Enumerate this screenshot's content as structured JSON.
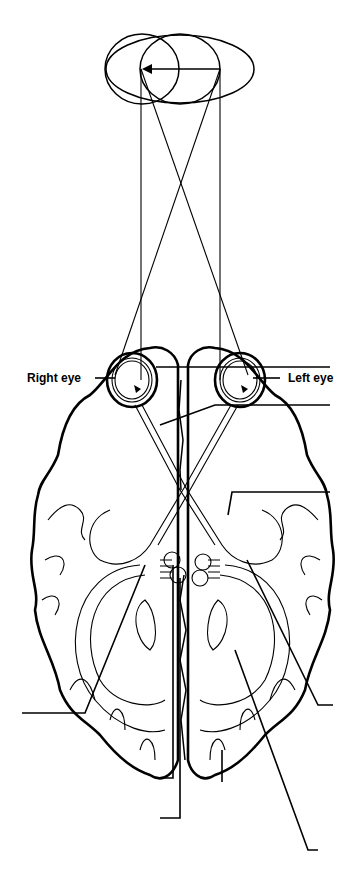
{
  "diagram": {
    "title": "",
    "labels": {
      "right_eye": "Right eye",
      "left_eye": "Left eye"
    },
    "visual_field": {
      "shape": "two overlapping ellipses",
      "arrow_direction": "right-to-left"
    },
    "leader_lines": [
      {
        "id": "leader-1",
        "side": "right",
        "y": 367,
        "text": ""
      },
      {
        "id": "leader-2",
        "side": "right",
        "y": 405,
        "text": ""
      },
      {
        "id": "leader-3",
        "side": "right",
        "y": 492,
        "text": ""
      },
      {
        "id": "leader-4",
        "side": "right",
        "y": 705,
        "text": ""
      },
      {
        "id": "leader-5",
        "side": "left",
        "y": 713,
        "text": ""
      },
      {
        "id": "leader-6",
        "side": "bottom",
        "y": 778,
        "text": ""
      },
      {
        "id": "leader-7",
        "side": "bottom",
        "y": 818,
        "text": ""
      },
      {
        "id": "leader-8",
        "side": "bottom",
        "y": 850,
        "text": ""
      }
    ],
    "colors": {
      "ink": "#000000",
      "background": "#ffffff"
    }
  }
}
